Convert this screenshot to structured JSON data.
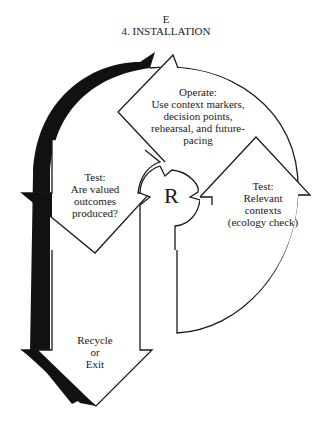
{
  "header": {
    "letter": "E",
    "title": "4. INSTALLATION"
  },
  "center": {
    "label": "R"
  },
  "nodes": [
    {
      "id": "operate",
      "lines": [
        "Operate:",
        "Use context markers,",
        "decision points,",
        "rehearsal, and future-",
        "pacing"
      ]
    },
    {
      "id": "test-valued",
      "lines": [
        "Test:",
        "Are valued",
        "outcomes",
        "produced?"
      ]
    },
    {
      "id": "test-ecology",
      "lines": [
        "Test:",
        "Relevant",
        "contexts",
        "(ecology check)"
      ]
    },
    {
      "id": "recycle",
      "lines": [
        "Recycle",
        "or",
        "Exit"
      ]
    }
  ],
  "colors": {
    "stroke": "#1a1a1a",
    "fill": "#ffffff",
    "shadow": "#111111"
  }
}
